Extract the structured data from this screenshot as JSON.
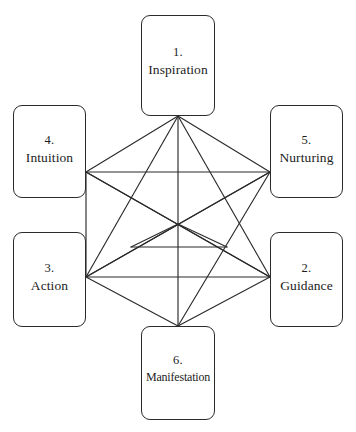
{
  "diagram": {
    "background_color": "#ffffff",
    "line_color": "#2b2b2b",
    "text_color": "#1c1c1c",
    "nodes": [
      {
        "id": "node-1",
        "number": "1.",
        "label": "Inspiration",
        "position": "top"
      },
      {
        "id": "node-2",
        "number": "2.",
        "label": "Guidance",
        "position": "bottom-right"
      },
      {
        "id": "node-3",
        "number": "3.",
        "label": "Action",
        "position": "bottom-left"
      },
      {
        "id": "node-4",
        "number": "4.",
        "label": "Intuition",
        "position": "top-left"
      },
      {
        "id": "node-5",
        "number": "5.",
        "label": "Nurturing",
        "position": "top-right"
      },
      {
        "id": "node-6",
        "number": "6.",
        "label": "Manifestation",
        "position": "bottom"
      }
    ],
    "edges": [
      {
        "from": "node-1",
        "to": "node-2"
      },
      {
        "from": "node-1",
        "to": "node-3"
      },
      {
        "from": "node-1",
        "to": "node-4"
      },
      {
        "from": "node-1",
        "to": "node-5"
      },
      {
        "from": "node-1",
        "to": "node-6"
      },
      {
        "from": "node-2",
        "to": "node-3"
      },
      {
        "from": "node-2",
        "to": "node-4"
      },
      {
        "from": "node-2",
        "to": "node-5"
      },
      {
        "from": "node-2",
        "to": "node-6"
      },
      {
        "from": "node-3",
        "to": "node-4"
      },
      {
        "from": "node-3",
        "to": "node-5"
      },
      {
        "from": "node-3",
        "to": "node-6"
      },
      {
        "from": "node-4",
        "to": "node-5"
      },
      {
        "from": "node-5",
        "to": "node-6"
      }
    ]
  }
}
